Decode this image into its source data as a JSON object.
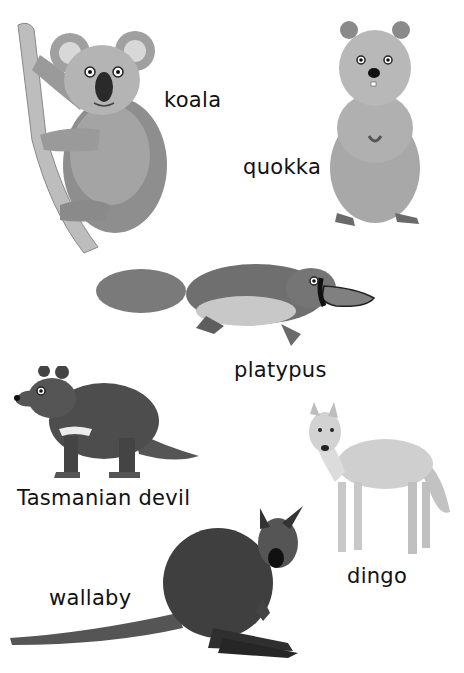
{
  "page": {
    "background": "#ffffff"
  },
  "animals": [
    {
      "name": "koala",
      "label": "koala"
    },
    {
      "name": "quokka",
      "label": "quokka"
    },
    {
      "name": "platypus",
      "label": "platypus"
    },
    {
      "name": "tasmanian-devil",
      "label": "Tasmanian devil"
    },
    {
      "name": "dingo",
      "label": "dingo"
    },
    {
      "name": "wallaby",
      "label": "wallaby"
    }
  ]
}
